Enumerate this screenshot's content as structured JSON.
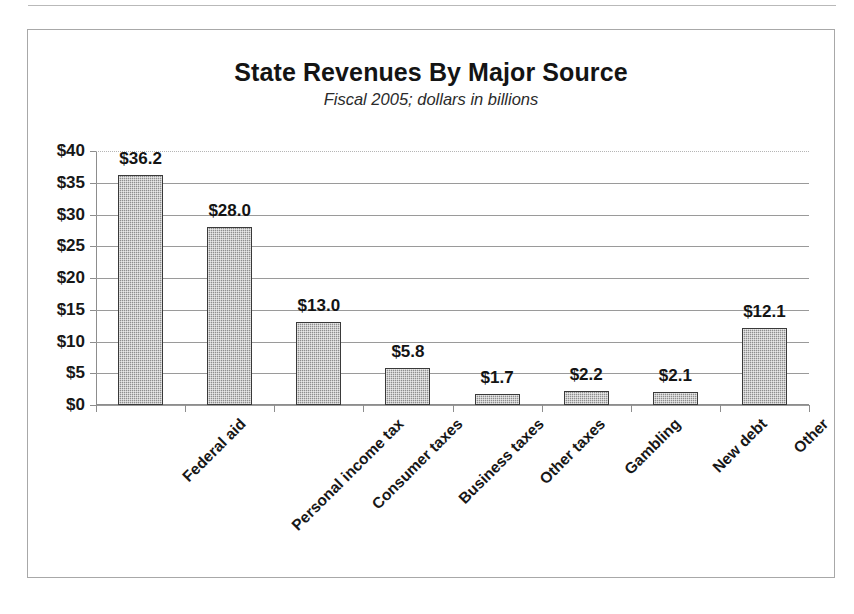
{
  "figure": {
    "title": "State Revenues By Major Source",
    "subtitle": "Fiscal 2005; dollars in billions"
  },
  "chart_data": {
    "type": "bar",
    "title": "State Revenues By Major Source",
    "subtitle": "Fiscal 2005; dollars in billions",
    "xlabel": "",
    "ylabel": "",
    "ylim": [
      0,
      40
    ],
    "ytick_step": 5,
    "ytick_labels": [
      "$40",
      "$35",
      "$30",
      "$25",
      "$20",
      "$15",
      "$10",
      "$5",
      "$0"
    ],
    "ytick_values": [
      40,
      35,
      30,
      25,
      20,
      15,
      10,
      5,
      0
    ],
    "grid": true,
    "legend": false,
    "categories": [
      "Federal aid",
      "Personal income tax",
      "Consumer taxes",
      "Business taxes",
      "Other taxes",
      "Gambling",
      "New debt",
      "Other"
    ],
    "values": [
      36.2,
      28.0,
      13.0,
      5.8,
      1.7,
      2.2,
      2.1,
      12.1
    ],
    "data_labels": [
      "$36.2",
      "$28.0",
      "$13.0",
      "$5.8",
      "$1.7",
      "$2.2",
      "$2.1",
      "$12.1"
    ],
    "bar_color": "#8e8e8e",
    "bar_edge_color": "#3a3a3a"
  }
}
